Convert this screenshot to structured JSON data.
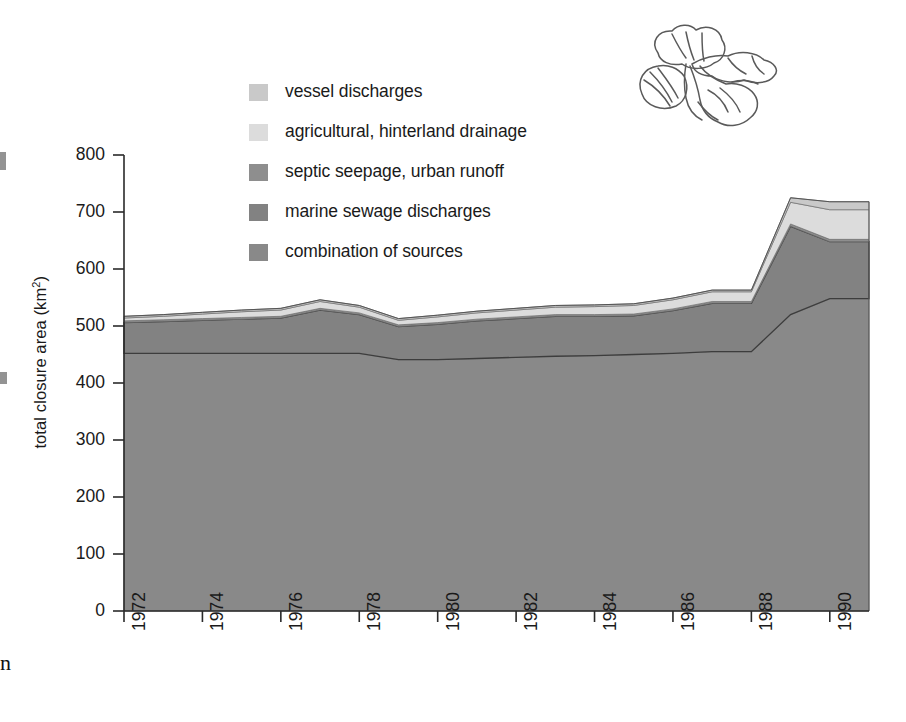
{
  "figure": {
    "decoration_icon": "shellfish-line-drawing",
    "background_color": "#ffffff"
  },
  "axes": {
    "y_title": "total closure area (km",
    "y_title_sup": "2",
    "y_title_tail": ")",
    "y_ticks": [
      "800",
      "700",
      "600",
      "500",
      "400",
      "300",
      "200",
      "100",
      "0"
    ],
    "x_ticks": [
      "1972",
      "1974",
      "1976",
      "1978",
      "1980",
      "1982",
      "1984",
      "1986",
      "1988",
      "1990"
    ]
  },
  "legend": {
    "items": [
      {
        "label": "vessel discharges",
        "color": "#c9c9c9"
      },
      {
        "label": "agricultural, hinterland drainage",
        "color": "#dcdcdc"
      },
      {
        "label": "septic seepage, urban runoff",
        "color": "#8e8e8e"
      },
      {
        "label": "marine sewage discharges",
        "color": "#828282"
      },
      {
        "label": "combination of sources",
        "color": "#898989"
      }
    ]
  },
  "edge_artifacts": {
    "glyph": "n"
  },
  "chart_data": {
    "type": "area",
    "title": "",
    "subtitle": "",
    "xlabel": "",
    "ylabel": "total closure area (km2)",
    "xlim": [
      1972,
      1991
    ],
    "ylim": [
      0,
      800
    ],
    "grid": false,
    "legend_position": "upper-left-inside",
    "stacked": true,
    "stack_order_bottom_to_top": [
      "combination of sources",
      "marine sewage discharges",
      "septic seepage, urban runoff",
      "agricultural, hinterland drainage",
      "vessel discharges"
    ],
    "x": [
      1972,
      1973,
      1974,
      1975,
      1976,
      1977,
      1978,
      1979,
      1980,
      1981,
      1982,
      1983,
      1984,
      1985,
      1986,
      1987,
      1988,
      1989,
      1990,
      1991
    ],
    "series": [
      {
        "name": "combination of sources",
        "color": "#898989",
        "values": [
          452,
          452,
          452,
          452,
          452,
          452,
          452,
          441,
          441,
          443,
          445,
          447,
          448,
          450,
          452,
          455,
          455,
          520,
          548,
          548
        ]
      },
      {
        "name": "marine sewage discharges",
        "color": "#828282",
        "values": [
          54,
          56,
          58,
          60,
          62,
          76,
          68,
          58,
          62,
          66,
          68,
          70,
          69,
          68,
          75,
          85,
          85,
          155,
          100,
          100
        ]
      },
      {
        "name": "septic seepage, urban runoff",
        "color": "#8e8e8e",
        "values": [
          3,
          3,
          3,
          3,
          3,
          3,
          3,
          3,
          3,
          3,
          3,
          3,
          3,
          3,
          3,
          3,
          3,
          4,
          4,
          4
        ]
      },
      {
        "name": "agricultural, hinterland drainage",
        "color": "#dcdcdc",
        "values": [
          5,
          6,
          8,
          10,
          11,
          12,
          10,
          8,
          10,
          11,
          12,
          13,
          14,
          15,
          16,
          17,
          17,
          38,
          52,
          52
        ]
      },
      {
        "name": "vessel discharges",
        "color": "#c9c9c9",
        "values": [
          3,
          3,
          3,
          3,
          3,
          3,
          3,
          3,
          3,
          3,
          3,
          3,
          3,
          3,
          3,
          3,
          3,
          8,
          14,
          14
        ]
      }
    ],
    "totals": [
      517,
      520,
      524,
      528,
      531,
      546,
      536,
      513,
      519,
      526,
      531,
      536,
      537,
      539,
      549,
      563,
      563,
      725,
      718,
      718
    ]
  }
}
